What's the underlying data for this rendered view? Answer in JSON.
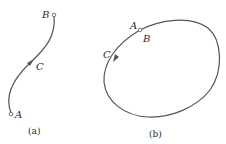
{
  "figure": {
    "panel_a": {
      "caption": "(a)",
      "labels": {
        "start": "A",
        "end": "B",
        "mid": "C"
      },
      "description": "open curved path from A to B with arrow at C"
    },
    "panel_b": {
      "caption": "(b)",
      "labels": {
        "start": "A",
        "end": "B",
        "mid": "C"
      },
      "description": "closed loop path where A and B coincide, arrow at C"
    },
    "colors": {
      "stroke": "#555555",
      "text": "#2a2a2a",
      "background": "#ffffff"
    }
  }
}
